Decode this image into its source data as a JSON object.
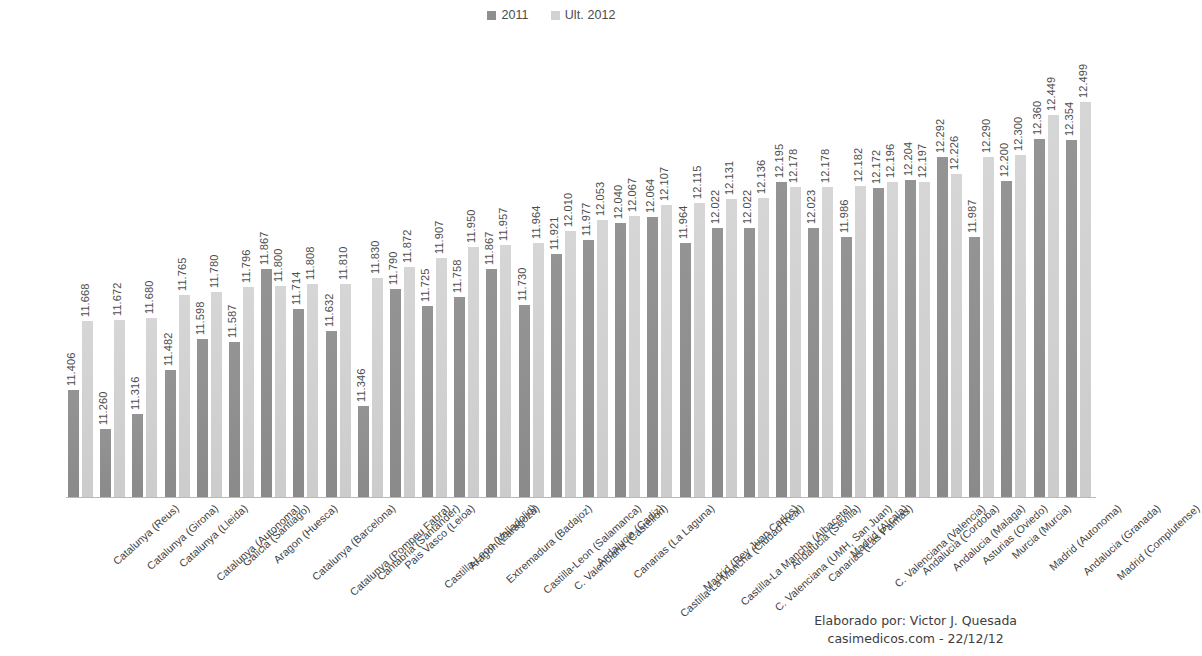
{
  "legend": {
    "entries": [
      {
        "label": "2011",
        "color": "#8e8e8e"
      },
      {
        "label": "Ult. 2012",
        "color": "#d1d1d1"
      }
    ]
  },
  "footer": {
    "line1": "Elaborado por: Victor J. Quesada",
    "line2": "casimedicos.com - 22/12/12"
  },
  "chart_data": {
    "type": "bar",
    "title": "",
    "xlabel": "",
    "ylabel": "",
    "ylim": [
      11.0,
      12.75
    ],
    "grid": false,
    "legend_position": "top-center",
    "categories": [
      "Catalunya (Reus)",
      "Catalunya (Girona)",
      "Catalunya (Lleida)",
      "Catalunya (Autonoma)",
      "Galicia (Santiago)",
      "Aragon (Huesca)",
      "Catalunya (Barcelona)",
      "Catalunya (Pompeu Fabra)",
      "Cantabria (Santander)",
      "Pais Vasco (Leioa)",
      "Castilla-Leon (Valladolid)",
      "Aragon (Zaragoza)",
      "Extremadura (Badajoz)",
      "Castilla-Leon (Salamanca)",
      "C. Valenciana (Castellon)",
      "Andalucia (Cadiz)",
      "Canarias (La Laguna)",
      "Castilla-La Mancha (Ciudad Real)",
      "Madrid (Rey Juan Carlos)",
      "Castilla-La Mancha (Albacete)",
      "C. Valenciana (UMH, San Juan)",
      "Andalucia (Sevilla)",
      "Canarias (Las Palmas)",
      "Madrid (Alcala)",
      "C. Valenciana (Valencia)",
      "Andalucia (Cordoba)",
      "Andalucia (Malaga)",
      "Asturias (Oviedo)",
      "Murcia (Murcia)",
      "Madrid (Autonoma)",
      "Andalucia (Granada)",
      "Madrid (Complutense)"
    ],
    "series": [
      {
        "name": "2011",
        "color": "#8e8e8e",
        "values": [
          11.406,
          11.26,
          11.316,
          11.482,
          11.598,
          11.587,
          11.867,
          11.714,
          11.632,
          11.346,
          11.79,
          11.725,
          11.758,
          11.867,
          11.73,
          11.921,
          11.977,
          12.04,
          12.064,
          11.964,
          12.022,
          12.022,
          12.195,
          12.023,
          11.986,
          12.172,
          12.204,
          12.292,
          11.987,
          12.2,
          12.36,
          12.354
        ],
        "labels": [
          "11.406",
          "11.260",
          "11.316",
          "11.482",
          "11.598",
          "11.587",
          "11.867",
          "11.714",
          "11.632",
          "11.346",
          "11.790",
          "11.725",
          "11.758",
          "11.867",
          "11.730",
          "11.921",
          "11.977",
          "12.040",
          "12.064",
          "11.964",
          "12.022",
          "12.022",
          "12.195",
          "12.023",
          "11.986",
          "12.172",
          "12.204",
          "12.292",
          "11.987",
          "12.200",
          "12.360",
          "12.354"
        ]
      },
      {
        "name": "Ult. 2012",
        "color": "#d1d1d1",
        "values": [
          11.668,
          11.672,
          11.68,
          11.765,
          11.78,
          11.796,
          11.8,
          11.808,
          11.81,
          11.83,
          11.872,
          11.907,
          11.95,
          11.957,
          11.964,
          12.01,
          12.053,
          12.067,
          12.107,
          12.115,
          12.131,
          12.136,
          12.178,
          12.178,
          12.182,
          12.196,
          12.197,
          12.226,
          12.29,
          12.3,
          12.449,
          12.499
        ],
        "labels": [
          "11.668",
          "11.672",
          "11.680",
          "11.765",
          "11.780",
          "11.796",
          "11.800",
          "11.808",
          "11.810",
          "11.830",
          "11.872",
          "11.907",
          "11.950",
          "11.957",
          "11.964",
          "12.010",
          "12.053",
          "12.067",
          "12.107",
          "12.115",
          "12.131",
          "12.136",
          "12.178",
          "12.178",
          "12.182",
          "12.196",
          "12.197",
          "12.226",
          "12.290",
          "12.300",
          "12.449",
          "12.499"
        ]
      }
    ]
  }
}
